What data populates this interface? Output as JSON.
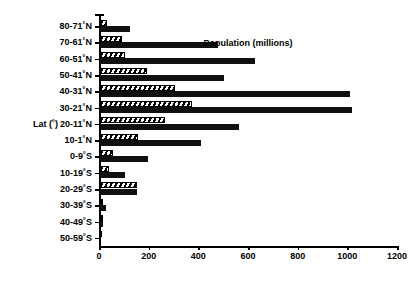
{
  "chart_data": {
    "type": "bar",
    "orientation": "horizontal",
    "title": "",
    "xlabel": "Population (millions)",
    "ylabel": "Lat (°)",
    "xlim": [
      0,
      1200
    ],
    "xticks": [
      0,
      200,
      400,
      600,
      800,
      1000,
      1200
    ],
    "xtick_labels": [
      "0",
      "200",
      "400",
      "600",
      "800",
      "1000",
      "1200"
    ],
    "grid": false,
    "legend": "none",
    "categories": [
      "80-71˚N",
      "70-61˚N",
      "60-51˚N",
      "50-41˚N",
      "40-31˚N",
      "30-21˚N",
      "20-11˚N",
      "10-1˚N",
      "0-9˚S",
      "10-19˚S",
      "20-29˚S",
      "30-39˚S",
      "40-49˚S",
      "50-59˚S"
    ],
    "series": [
      {
        "name": "hatched",
        "style": "hatched",
        "values": [
          30,
          88,
          100,
          190,
          300,
          372,
          262,
          152,
          53,
          36,
          150,
          14,
          8,
          0
        ]
      },
      {
        "name": "solid",
        "style": "solid",
        "values": [
          122,
          476,
          626,
          500,
          1006,
          1014,
          558,
          408,
          194,
          100,
          150,
          26,
          14,
          0
        ]
      }
    ]
  },
  "axis": {
    "y_axis_title": "Lat (˚)",
    "x_axis_title": "Population (millions)"
  }
}
